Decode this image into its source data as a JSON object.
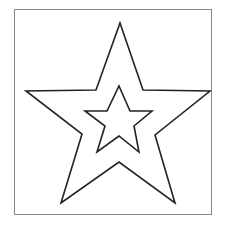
{
  "figure": {
    "frame_color": "#8a8a8a",
    "stroke_color": "#222222",
    "fill_color": "#ffffff",
    "outer_star": {
      "points": "120,23 143,90 210,91 155,135 175,203 119,162 61,203 82,134 26,91 96,90"
    },
    "inner_star": {
      "points": "119,86 130,111 152,111 134,126 139,152 119,136 97,152 105,126 85,111 107,111"
    }
  }
}
